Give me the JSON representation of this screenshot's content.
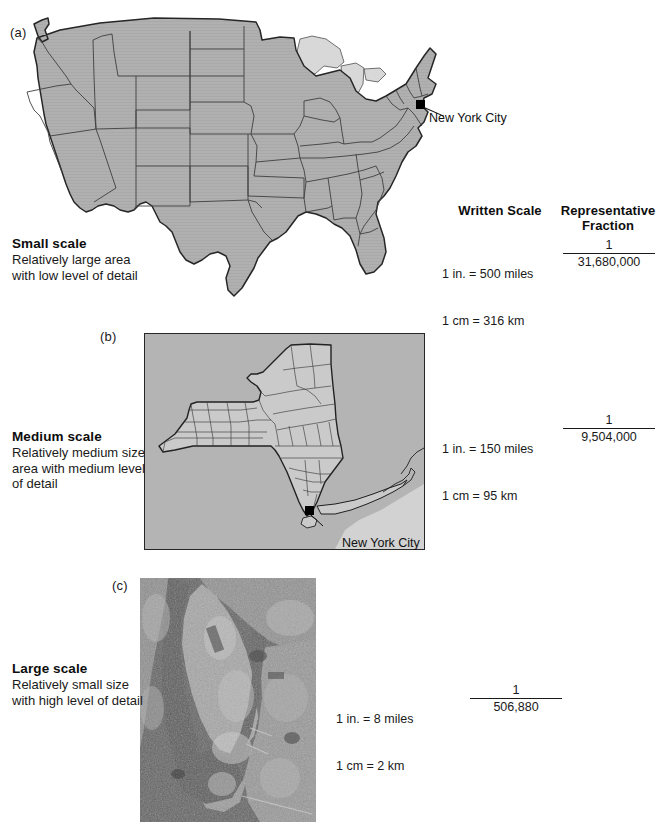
{
  "figure": {
    "title": "Map Scale Comparison",
    "panels": [
      {
        "letter": "(a)",
        "scale_title": "Small scale",
        "scale_desc_line1": "Relatively large area",
        "scale_desc_line2": "with low level of detail",
        "written_scale_line1": "1 in. = 500 miles",
        "written_scale_line2": "1 cm = 316 km",
        "rf_numerator": "1",
        "rf_denominator": "31,680,000",
        "map_subject": "united-states-map",
        "city_label": "New York City"
      },
      {
        "letter": "(b)",
        "scale_title": "Medium scale",
        "scale_desc_line1": "Relatively medium size",
        "scale_desc_line2": "area with medium level",
        "scale_desc_line3": "of detail",
        "written_scale_line1": "1 in. = 150 miles",
        "written_scale_line2": "1 cm = 95 km",
        "rf_numerator": "1",
        "rf_denominator": "9,504,000",
        "map_subject": "new-york-state-map",
        "city_label": "New York City"
      },
      {
        "letter": "(c)",
        "scale_title": "Large scale",
        "scale_desc_line1": "Relatively small size",
        "scale_desc_line2": "with high level of detail",
        "written_scale_line1": "1 in. = 8 miles",
        "written_scale_line2": "1 cm = 2 km",
        "rf_numerator": "1",
        "rf_denominator": "506,880",
        "map_subject": "manhattan-satellite-photo"
      }
    ],
    "columns": {
      "written_scale_heading": "Written Scale",
      "representative_fraction_heading_line1": "Representative",
      "representative_fraction_heading_line2": "Fraction"
    }
  },
  "colors": {
    "land_fill": "#b0b0b0",
    "state_fill_light": "#c9c9c9",
    "border_stroke": "#262626",
    "water_fill": "#d8d8d8",
    "marker": "#000000",
    "text": "#1a1a1a",
    "page_background": "#ffffff"
  }
}
